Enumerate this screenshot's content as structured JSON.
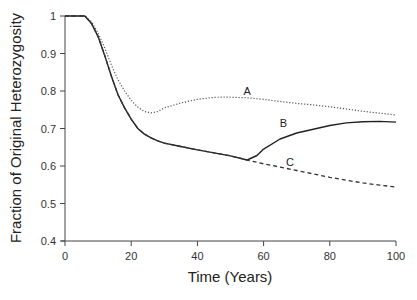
{
  "chart_data": {
    "type": "line",
    "title": "",
    "xlabel": "Time (Years)",
    "ylabel": "Fraction of Original Heterozygosity",
    "xlim": [
      0,
      100
    ],
    "ylim": [
      0.4,
      1.0
    ],
    "xticks": [
      0,
      20,
      40,
      60,
      80,
      100
    ],
    "yticks": [
      0.4,
      0.5,
      0.6,
      0.7,
      0.8,
      0.9,
      1.0
    ],
    "ytick_labels": [
      "0.4",
      "0.5",
      "0.6",
      "0.7",
      "0.8",
      "0.9",
      "1"
    ],
    "grid": false,
    "legend": "none (inline curve labels)",
    "series": [
      {
        "name": "A",
        "style": "dotted",
        "x": [
          0,
          6,
          8,
          10,
          12,
          14,
          16,
          18,
          20,
          22,
          24,
          26,
          28,
          30,
          35,
          40,
          45,
          48,
          55,
          60,
          65,
          70,
          75,
          80,
          85,
          90,
          95,
          100
        ],
        "y": [
          1.0,
          1.0,
          0.985,
          0.955,
          0.915,
          0.87,
          0.83,
          0.8,
          0.775,
          0.757,
          0.745,
          0.742,
          0.745,
          0.755,
          0.768,
          0.778,
          0.783,
          0.784,
          0.782,
          0.778,
          0.772,
          0.767,
          0.763,
          0.758,
          0.752,
          0.746,
          0.741,
          0.736
        ]
      },
      {
        "name": "B",
        "style": "solid",
        "x": [
          0,
          6,
          8,
          10,
          12,
          14,
          16,
          18,
          20,
          22,
          24,
          26,
          28,
          30,
          35,
          40,
          45,
          50,
          55,
          58,
          60,
          65,
          70,
          75,
          80,
          85,
          90,
          95,
          100
        ],
        "y": [
          1.0,
          1.0,
          0.98,
          0.945,
          0.895,
          0.84,
          0.79,
          0.755,
          0.725,
          0.7,
          0.685,
          0.675,
          0.667,
          0.661,
          0.652,
          0.643,
          0.635,
          0.627,
          0.616,
          0.628,
          0.645,
          0.672,
          0.688,
          0.698,
          0.708,
          0.715,
          0.718,
          0.719,
          0.717
        ]
      },
      {
        "name": "C",
        "style": "dashed",
        "x": [
          0,
          6,
          8,
          10,
          12,
          14,
          16,
          18,
          20,
          22,
          24,
          26,
          28,
          30,
          35,
          40,
          45,
          50,
          55,
          60,
          65,
          70,
          75,
          80,
          85,
          90,
          95,
          100
        ],
        "y": [
          1.0,
          1.0,
          0.98,
          0.945,
          0.895,
          0.84,
          0.79,
          0.755,
          0.725,
          0.7,
          0.685,
          0.675,
          0.667,
          0.661,
          0.652,
          0.643,
          0.635,
          0.627,
          0.616,
          0.606,
          0.597,
          0.588,
          0.579,
          0.57,
          0.562,
          0.555,
          0.549,
          0.544
        ]
      }
    ],
    "annotations": [
      {
        "text": "A",
        "x": 55,
        "y": 0.79
      },
      {
        "text": "B",
        "x": 66,
        "y": 0.705
      },
      {
        "text": "C",
        "x": 68,
        "y": 0.6
      }
    ]
  }
}
